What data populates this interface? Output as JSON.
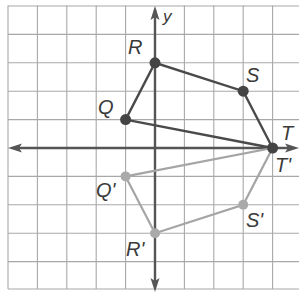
{
  "diagram": {
    "type": "coordinate-plane-reflection",
    "grid": {
      "xmin": -5,
      "xmax": 5,
      "ymin": -5,
      "ymax": 5,
      "step": 1
    },
    "axes": {
      "x_label": "",
      "y_label": "y"
    },
    "colors": {
      "grid": "#a8a8a8",
      "axis": "#555555",
      "original": "#4a4a4a",
      "image": "#a0a0a0"
    },
    "original": {
      "name": "QRST",
      "points": [
        {
          "label": "Q",
          "x": -1,
          "y": 1
        },
        {
          "label": "R",
          "x": 0,
          "y": 3
        },
        {
          "label": "S",
          "x": 3,
          "y": 2
        },
        {
          "label": "T",
          "x": 4,
          "y": 0
        }
      ]
    },
    "image": {
      "name": "Q'R'S'T'",
      "points": [
        {
          "label": "Q'",
          "x": -1,
          "y": -1
        },
        {
          "label": "R'",
          "x": 0,
          "y": -3
        },
        {
          "label": "S'",
          "x": 3,
          "y": -2
        },
        {
          "label": "T'",
          "x": 4,
          "y": 0
        }
      ]
    }
  },
  "labels": {
    "y": "y",
    "Q": "Q",
    "R": "R",
    "S": "S",
    "T": "T",
    "Qp": "Q'",
    "Rp": "R'",
    "Sp": "S'",
    "Tp": "T'"
  }
}
